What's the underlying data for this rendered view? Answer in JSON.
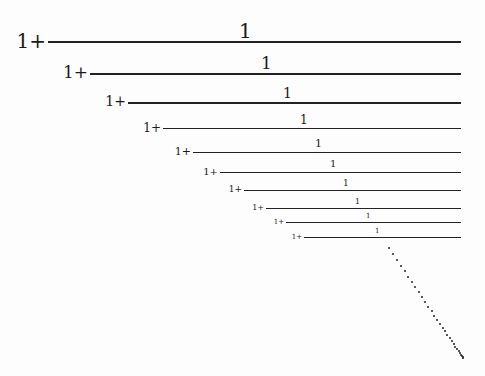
{
  "prefix_text": "1+",
  "numerator_text": "1",
  "line_right_x": 461,
  "terms": [
    {
      "prefix": "1+",
      "numerator": "1",
      "line_y": 41,
      "line_x": 48,
      "num_x": 239,
      "num_y": 19,
      "size": 20
    },
    {
      "prefix": "1+",
      "numerator": "1",
      "line_y": 73,
      "line_x": 90,
      "num_x": 261,
      "num_y": 53,
      "size": 17
    },
    {
      "prefix": "1+",
      "numerator": "1",
      "line_y": 102,
      "line_x": 128,
      "num_x": 283,
      "num_y": 85,
      "size": 14
    },
    {
      "prefix": "1+",
      "numerator": "1",
      "line_y": 128,
      "line_x": 163,
      "num_x": 300,
      "num_y": 113,
      "size": 12
    },
    {
      "prefix": "1+",
      "numerator": "1",
      "line_y": 152,
      "line_x": 193,
      "num_x": 315,
      "num_y": 137,
      "size": 11
    },
    {
      "prefix": "1+",
      "numerator": "1",
      "line_y": 172,
      "line_x": 220,
      "num_x": 330,
      "num_y": 158,
      "size": 10
    },
    {
      "prefix": "1+",
      "numerator": "1",
      "line_y": 190,
      "line_x": 244,
      "num_x": 343,
      "num_y": 178,
      "size": 9
    },
    {
      "prefix": "1+",
      "numerator": "1",
      "line_y": 208,
      "line_x": 266,
      "num_x": 355,
      "num_y": 197,
      "size": 8
    },
    {
      "prefix": "1+",
      "numerator": "1",
      "line_y": 222,
      "line_x": 286,
      "num_x": 366,
      "num_y": 212,
      "size": 7
    },
    {
      "prefix": "1+",
      "numerator": "1",
      "line_y": 237,
      "line_x": 304,
      "num_x": 375,
      "num_y": 227,
      "size": 7
    }
  ],
  "ellipsis": {
    "from": [
      388,
      247
    ],
    "to": [
      462,
      357
    ],
    "count": 30
  }
}
